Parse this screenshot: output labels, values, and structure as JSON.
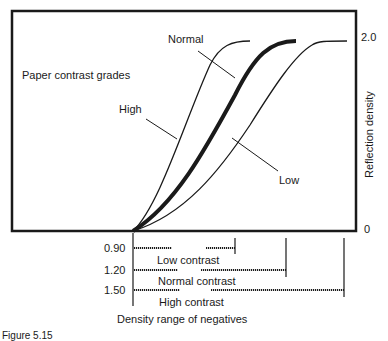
{
  "diagram": {
    "title": "Paper contrast grades",
    "y_axis_label": "Reflection density",
    "y_ticks": [
      "2.0",
      "0"
    ],
    "curve_labels": {
      "normal": "Normal",
      "high": "High",
      "low": "Low"
    },
    "density_ranges": [
      {
        "value": "0.90",
        "label": "Low contrast"
      },
      {
        "value": "1.20",
        "label": "Normal contrast"
      },
      {
        "value": "1.50",
        "label": "High contrast"
      }
    ],
    "x_axis_label": "Density range of negatives",
    "caption": "Figure 5.15"
  },
  "colors": {
    "ink": "#1a1a1a",
    "background": "#ffffff"
  }
}
